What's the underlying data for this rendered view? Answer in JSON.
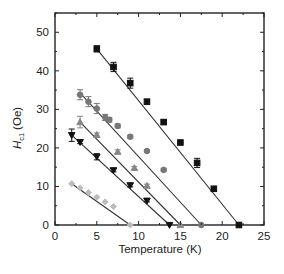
{
  "chart_data": {
    "type": "scatter",
    "title": "",
    "xlabel": "Temperature (K)",
    "ylabel": "H_c1 (Oe)",
    "ylabel_main": "H",
    "ylabel_sub": "c1",
    "ylabel_unit": "(Oe)",
    "xlim": [
      0,
      25
    ],
    "ylim": [
      0,
      55
    ],
    "xticks": [
      0,
      5,
      10,
      15,
      20,
      25
    ],
    "yticks": [
      0,
      10,
      20,
      30,
      40,
      50
    ],
    "grid": false,
    "legend": "none",
    "series": [
      {
        "name": "squares",
        "marker": "square",
        "color": "#111111",
        "x": [
          5,
          7,
          9,
          11,
          13,
          15,
          17,
          19,
          22
        ],
        "y": [
          45.7,
          41.0,
          36.8,
          32.0,
          26.7,
          21.4,
          16.1,
          9.4,
          0
        ],
        "errors": [
          0.8,
          1.2,
          1.3,
          0,
          0.6,
          0,
          1.2,
          0,
          0
        ],
        "fit_line": [
          [
            5,
            45.7
          ],
          [
            22,
            0
          ]
        ]
      },
      {
        "name": "circles",
        "marker": "circle",
        "color": "#777777",
        "x": [
          3,
          4,
          5,
          6,
          6.5,
          7.5,
          9,
          11,
          13,
          17.5
        ],
        "y": [
          33.8,
          32.0,
          30.2,
          27.9,
          27.3,
          25.7,
          22.9,
          19.2,
          14.3,
          0
        ],
        "errors": [
          1.3,
          1.3,
          1.3,
          0.8,
          0.6,
          0.5,
          0.4,
          0.3,
          0.3,
          0
        ],
        "fit_line": [
          [
            3,
            34.3
          ],
          [
            17.5,
            0
          ]
        ]
      },
      {
        "name": "up-triangles",
        "marker": "triangle-up",
        "color": "#888888",
        "x": [
          3,
          5,
          7.5,
          9.5,
          11,
          15
        ],
        "y": [
          26.7,
          23.4,
          19.0,
          14.8,
          10.2,
          0
        ],
        "errors": [
          1.5,
          0.5,
          0.5,
          0.4,
          0.4,
          0
        ],
        "fit_line": [
          [
            3,
            26.7
          ],
          [
            15,
            0
          ]
        ]
      },
      {
        "name": "down-triangles",
        "marker": "triangle-down",
        "color": "#111111",
        "x": [
          2,
          3,
          5,
          7,
          9,
          11,
          13.7
        ],
        "y": [
          23.3,
          21.5,
          17.7,
          14.2,
          10.3,
          6.3,
          0
        ],
        "errors": [
          1.6,
          0.4,
          0.8,
          0.4,
          0.4,
          0.3,
          0
        ],
        "fit_line": [
          [
            2,
            23.3
          ],
          [
            13.7,
            0
          ]
        ]
      },
      {
        "name": "diamonds",
        "marker": "diamond",
        "color": "#bbbbbb",
        "x": [
          2,
          3,
          4,
          5,
          6,
          7,
          9
        ],
        "y": [
          10.7,
          9.6,
          8.4,
          7.2,
          6.0,
          4.8,
          0
        ],
        "errors": [
          0,
          0,
          0,
          0,
          0,
          0,
          0
        ],
        "fit_line": [
          [
            2,
            10.7
          ],
          [
            9,
            0
          ]
        ]
      }
    ]
  }
}
